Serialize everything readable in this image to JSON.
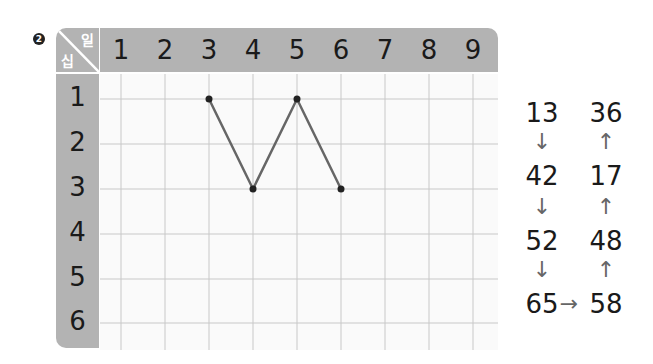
{
  "problem_number": "2",
  "corner": {
    "ones_label": "일",
    "tens_label": "십"
  },
  "columns": [
    "1",
    "2",
    "3",
    "4",
    "5",
    "6",
    "7",
    "8",
    "9"
  ],
  "rows": [
    "1",
    "2",
    "3",
    "4",
    "5",
    "6"
  ],
  "path_points": [
    {
      "tens": 1,
      "ones": 3
    },
    {
      "tens": 3,
      "ones": 4
    },
    {
      "tens": 1,
      "ones": 5
    },
    {
      "tens": 3,
      "ones": 6
    }
  ],
  "sequence": {
    "left": [
      "13",
      "42",
      "52",
      "65"
    ],
    "right": [
      "36",
      "17",
      "48",
      "58"
    ],
    "down_arrow": "↓",
    "up_arrow": "↑",
    "right_arrow": "→"
  },
  "colors": {
    "header_bg": "#b3b3b3",
    "grid_line": "#c8c8c8",
    "path": "#666666",
    "dot": "#222222"
  }
}
